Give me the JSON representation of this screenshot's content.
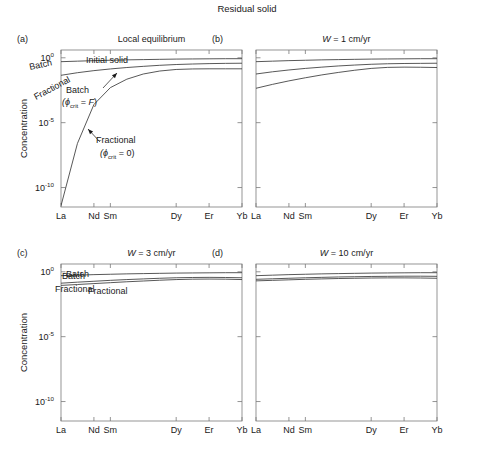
{
  "figure": {
    "title": "Residual solid",
    "ylabel": "Concentration",
    "background": "#ffffff",
    "line_color": "#3a3a3a",
    "axis_color": "#7a7a7a",
    "text_color": "#1a1a1a"
  },
  "axes": {
    "x_categories": [
      "La",
      "Nd",
      "Sm",
      "Dy",
      "Er",
      "Yb"
    ],
    "x_tick_values": [
      0,
      2,
      3,
      7,
      9,
      11
    ],
    "x_range": [
      0,
      11
    ],
    "y_tick_labels": [
      "10",
      "10",
      "10"
    ],
    "y_tick_exponents": [
      "0",
      "-5",
      "-10"
    ],
    "y_log_ticks": [
      0,
      -5,
      -10
    ],
    "y_range": [
      -11.5,
      0.6
    ],
    "grid": false,
    "legend": "inline-annotations"
  },
  "panels": [
    {
      "tag": "(a)",
      "title": "Local equilibrium",
      "show_ylabel": true,
      "show_ytick_labels": true,
      "annotations": [
        {
          "name": "initial-solid-label",
          "text": "Initial solid",
          "x": 86,
          "y": 63,
          "rotate": 0
        },
        {
          "name": "batch-label",
          "text": "Batch",
          "x": 66,
          "y": 93,
          "rotate": 0
        },
        {
          "name": "batch-sub-label",
          "text": "(ϕ",
          "sub": "crit",
          "tail": " = F)",
          "x": 62,
          "y": 105,
          "rotate": 0
        },
        {
          "name": "fractional-label",
          "text": "Fractional",
          "x": 96,
          "y": 143,
          "rotate": 0
        },
        {
          "name": "fractional-sub-label",
          "text": "(ϕ",
          "sub": "crit",
          "tail": " = 0)",
          "x": 100,
          "y": 156,
          "rotate": 0
        }
      ],
      "series": [
        {
          "name": "initial-solid",
          "label": "Initial solid",
          "x": [
            0,
            1,
            2,
            3,
            4,
            5,
            6,
            7,
            8,
            9,
            10,
            11
          ],
          "y": [
            -0.3,
            -0.26,
            -0.22,
            -0.19,
            -0.16,
            -0.14,
            -0.12,
            -0.1,
            -0.09,
            -0.08,
            -0.07,
            -0.07
          ]
        },
        {
          "name": "batch",
          "label": "Batch",
          "x": [
            0,
            1,
            2,
            3,
            4,
            5,
            6,
            7,
            8,
            9,
            10,
            11
          ],
          "y": [
            -1.35,
            -1.15,
            -0.99,
            -0.86,
            -0.75,
            -0.66,
            -0.58,
            -0.52,
            -0.48,
            -0.45,
            -0.43,
            -0.42
          ]
        },
        {
          "name": "fractional",
          "label": "Fractional",
          "x": [
            0,
            1,
            2,
            3,
            4,
            5,
            6,
            7,
            8,
            9,
            10,
            11
          ],
          "y": [
            -11.4,
            -6.6,
            -3.6,
            -2.3,
            -1.65,
            -1.25,
            -1.02,
            -0.9,
            -0.86,
            -0.85,
            -0.85,
            -0.85
          ]
        }
      ]
    },
    {
      "tag": "(b)",
      "title": "W = 1 cm/yr",
      "title_italic_lead": "W",
      "show_ylabel": false,
      "show_ytick_labels": false,
      "annotations": [
        {
          "name": "batch-label",
          "text": "Batch",
          "x": 30,
          "y": 70,
          "rotate": -12
        },
        {
          "name": "fractional-label",
          "text": "Fractional",
          "x": 36,
          "y": 100,
          "rotate": -28
        }
      ],
      "series": [
        {
          "name": "initial-solid",
          "label": "Initial solid",
          "x": [
            0,
            1,
            2,
            3,
            4,
            5,
            6,
            7,
            8,
            9,
            10,
            11
          ],
          "y": [
            -0.3,
            -0.26,
            -0.22,
            -0.19,
            -0.16,
            -0.14,
            -0.12,
            -0.1,
            -0.09,
            -0.08,
            -0.07,
            -0.07
          ]
        },
        {
          "name": "batch",
          "label": "Batch",
          "x": [
            0,
            1,
            2,
            3,
            4,
            5,
            6,
            7,
            8,
            9,
            10,
            11
          ],
          "y": [
            -1.25,
            -1.08,
            -0.94,
            -0.82,
            -0.72,
            -0.63,
            -0.56,
            -0.5,
            -0.46,
            -0.44,
            -0.43,
            -0.42
          ]
        },
        {
          "name": "fractional",
          "label": "Fractional",
          "x": [
            0,
            1,
            2,
            3,
            4,
            5,
            6,
            7,
            8,
            9,
            10,
            11
          ],
          "y": [
            -2.35,
            -2.05,
            -1.78,
            -1.54,
            -1.32,
            -1.13,
            -0.96,
            -0.82,
            -0.74,
            -0.72,
            -0.73,
            -0.75
          ]
        }
      ]
    },
    {
      "tag": "(c)",
      "title": "W = 3 cm/yr",
      "title_italic_lead": "W",
      "show_ylabel": true,
      "show_ytick_labels": true,
      "annotations": [
        {
          "name": "batch-label",
          "text": "Batch",
          "x": 62,
          "y": 279,
          "rotate": 0
        },
        {
          "name": "fractional-label",
          "text": "Fractional",
          "x": 88,
          "y": 294,
          "rotate": 0
        }
      ],
      "series": [
        {
          "name": "initial-solid",
          "label": "Initial solid",
          "x": [
            0,
            1,
            2,
            3,
            4,
            5,
            6,
            7,
            8,
            9,
            10,
            11
          ],
          "y": [
            -0.3,
            -0.26,
            -0.22,
            -0.19,
            -0.16,
            -0.14,
            -0.12,
            -0.1,
            -0.09,
            -0.08,
            -0.07,
            -0.07
          ]
        },
        {
          "name": "batch",
          "label": "Batch",
          "x": [
            0,
            1,
            2,
            3,
            4,
            5,
            6,
            7,
            8,
            9,
            10,
            11
          ],
          "y": [
            -0.88,
            -0.8,
            -0.73,
            -0.66,
            -0.6,
            -0.55,
            -0.5,
            -0.46,
            -0.44,
            -0.43,
            -0.44,
            -0.46
          ]
        },
        {
          "name": "fractional",
          "label": "Fractional",
          "x": [
            0,
            1,
            2,
            3,
            4,
            5,
            6,
            7,
            8,
            9,
            10,
            11
          ],
          "y": [
            -1.05,
            -0.98,
            -0.91,
            -0.84,
            -0.77,
            -0.71,
            -0.65,
            -0.6,
            -0.57,
            -0.56,
            -0.57,
            -0.6
          ]
        }
      ]
    },
    {
      "tag": "(d)",
      "title": "W = 10 cm/yr",
      "title_italic_lead": "W",
      "show_ylabel": false,
      "show_ytick_labels": false,
      "annotations": [
        {
          "name": "batch-label",
          "text": "Batch",
          "x": 66,
          "y": 277,
          "rotate": 0
        },
        {
          "name": "fractional-label",
          "text": "Fractional",
          "x": 55,
          "y": 292,
          "rotate": 0
        }
      ],
      "series": [
        {
          "name": "initial-solid",
          "label": "Initial solid",
          "x": [
            0,
            1,
            2,
            3,
            4,
            5,
            6,
            7,
            8,
            9,
            10,
            11
          ],
          "y": [
            -0.3,
            -0.26,
            -0.22,
            -0.19,
            -0.16,
            -0.14,
            -0.12,
            -0.1,
            -0.09,
            -0.08,
            -0.07,
            -0.07
          ]
        },
        {
          "name": "batch",
          "label": "Batch",
          "x": [
            0,
            1,
            2,
            3,
            4,
            5,
            6,
            7,
            8,
            9,
            10,
            11
          ],
          "y": [
            -0.58,
            -0.54,
            -0.5,
            -0.46,
            -0.43,
            -0.4,
            -0.38,
            -0.36,
            -0.35,
            -0.34,
            -0.34,
            -0.35
          ]
        },
        {
          "name": "fractional",
          "label": "Fractional",
          "x": [
            0,
            1,
            2,
            3,
            4,
            5,
            6,
            7,
            8,
            9,
            10,
            11
          ],
          "y": [
            -0.7,
            -0.66,
            -0.62,
            -0.58,
            -0.55,
            -0.52,
            -0.5,
            -0.48,
            -0.47,
            -0.47,
            -0.48,
            -0.5
          ]
        }
      ]
    }
  ],
  "chart_data": {
    "type": "line",
    "title": "Residual solid",
    "xlabel": "",
    "ylabel": "Concentration",
    "xlim": [
      0,
      11
    ],
    "ylim": [
      1e-11,
      4
    ],
    "yscale": "log",
    "grid": false,
    "categories": [
      "La",
      "Nd",
      "Sm",
      "Dy",
      "Er",
      "Yb"
    ],
    "subplots": [
      {
        "panel": "(a)",
        "title": "Local equilibrium",
        "series": [
          {
            "name": "Initial solid",
            "values_log10": [
              -0.3,
              -0.26,
              -0.22,
              -0.19,
              -0.16,
              -0.14,
              -0.12,
              -0.1,
              -0.09,
              -0.08,
              -0.07,
              -0.07
            ]
          },
          {
            "name": "Batch (phi_crit = F)",
            "values_log10": [
              -1.35,
              -1.15,
              -0.99,
              -0.86,
              -0.75,
              -0.66,
              -0.58,
              -0.52,
              -0.48,
              -0.45,
              -0.43,
              -0.42
            ]
          },
          {
            "name": "Fractional (phi_crit = 0)",
            "values_log10": [
              -11.4,
              -6.6,
              -3.6,
              -2.3,
              -1.65,
              -1.25,
              -1.02,
              -0.9,
              -0.86,
              -0.85,
              -0.85,
              -0.85
            ]
          }
        ]
      },
      {
        "panel": "(b)",
        "title": "W = 1 cm/yr",
        "series": [
          {
            "name": "Initial solid",
            "values_log10": [
              -0.3,
              -0.26,
              -0.22,
              -0.19,
              -0.16,
              -0.14,
              -0.12,
              -0.1,
              -0.09,
              -0.08,
              -0.07,
              -0.07
            ]
          },
          {
            "name": "Batch",
            "values_log10": [
              -1.25,
              -1.08,
              -0.94,
              -0.82,
              -0.72,
              -0.63,
              -0.56,
              -0.5,
              -0.46,
              -0.44,
              -0.43,
              -0.42
            ]
          },
          {
            "name": "Fractional",
            "values_log10": [
              -2.35,
              -2.05,
              -1.78,
              -1.54,
              -1.32,
              -1.13,
              -0.96,
              -0.82,
              -0.74,
              -0.72,
              -0.73,
              -0.75
            ]
          }
        ]
      },
      {
        "panel": "(c)",
        "title": "W = 3 cm/yr",
        "series": [
          {
            "name": "Initial solid",
            "values_log10": [
              -0.3,
              -0.26,
              -0.22,
              -0.19,
              -0.16,
              -0.14,
              -0.12,
              -0.1,
              -0.09,
              -0.08,
              -0.07,
              -0.07
            ]
          },
          {
            "name": "Batch",
            "values_log10": [
              -0.88,
              -0.8,
              -0.73,
              -0.66,
              -0.6,
              -0.55,
              -0.5,
              -0.46,
              -0.44,
              -0.43,
              -0.44,
              -0.46
            ]
          },
          {
            "name": "Fractional",
            "values_log10": [
              -1.05,
              -0.98,
              -0.91,
              -0.84,
              -0.77,
              -0.71,
              -0.65,
              -0.6,
              -0.57,
              -0.56,
              -0.57,
              -0.6
            ]
          }
        ]
      },
      {
        "panel": "(d)",
        "title": "W = 10 cm/yr",
        "series": [
          {
            "name": "Initial solid",
            "values_log10": [
              -0.3,
              -0.26,
              -0.22,
              -0.19,
              -0.16,
              -0.14,
              -0.12,
              -0.1,
              -0.09,
              -0.08,
              -0.07,
              -0.07
            ]
          },
          {
            "name": "Batch",
            "values_log10": [
              -0.58,
              -0.54,
              -0.5,
              -0.46,
              -0.43,
              -0.4,
              -0.38,
              -0.36,
              -0.35,
              -0.34,
              -0.34,
              -0.35
            ]
          },
          {
            "name": "Fractional",
            "values_log10": [
              -0.7,
              -0.66,
              -0.62,
              -0.58,
              -0.55,
              -0.52,
              -0.5,
              -0.48,
              -0.47,
              -0.47,
              -0.48,
              -0.5
            ]
          }
        ]
      }
    ]
  }
}
